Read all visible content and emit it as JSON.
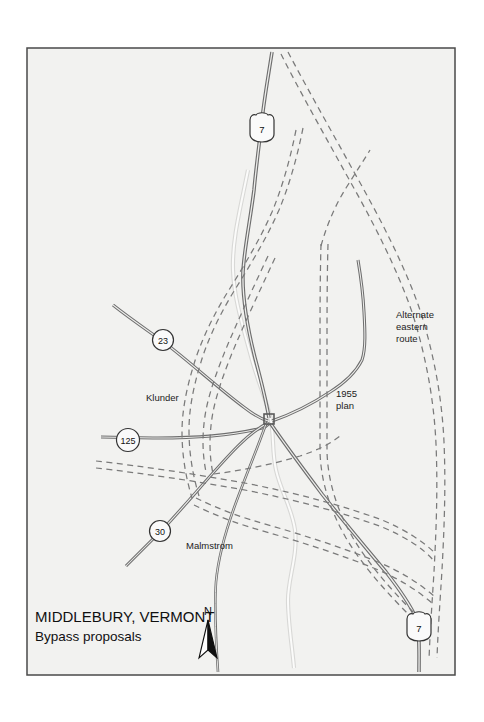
{
  "figure": {
    "kind": "map",
    "background_color": "#ffffff",
    "map_fill_color": "#f2f2f0",
    "border_color": "#4a4a4a",
    "road_color": "#6e6e6e",
    "road_casing_color": "#555555",
    "river_color": "#cfcfcf",
    "dashed_color": "#7a7a7a",
    "text_color": "#101010"
  },
  "title": {
    "line1": "MIDDLEBURY, VERMONT",
    "line2": "Bypass proposals"
  },
  "north_arrow": {
    "label": "N",
    "name": "north-arrow"
  },
  "route_markers": [
    {
      "id": "route-7-north",
      "number": "7",
      "shape": "us-shield",
      "x": 262,
      "y": 129
    },
    {
      "id": "route-23",
      "number": "23",
      "shape": "circle",
      "x": 163,
      "y": 340
    },
    {
      "id": "route-125",
      "number": "125",
      "shape": "circle",
      "x": 128,
      "y": 440
    },
    {
      "id": "route-30",
      "number": "30",
      "shape": "circle",
      "x": 160,
      "y": 531
    },
    {
      "id": "route-7-south",
      "number": "7",
      "shape": "us-shield",
      "x": 419,
      "y": 628
    }
  ],
  "annotations": [
    {
      "id": "label-klunder",
      "text": "Klunder",
      "x": 146,
      "y": 401
    },
    {
      "id": "label-malmstrom",
      "text": "Malmstrom",
      "x": 186,
      "y": 549
    },
    {
      "id": "label-1955-plan",
      "lines": [
        "1955",
        "plan"
      ],
      "x": 336,
      "y": 397
    },
    {
      "id": "label-alternate-eastern-route",
      "lines": [
        "Alternate",
        "eastern",
        "route"
      ],
      "x": 396,
      "y": 318
    }
  ],
  "legend_semantics": {
    "solid_line": "existing highway",
    "dashed_line": "proposed bypass alignment",
    "pale_line": "river"
  }
}
